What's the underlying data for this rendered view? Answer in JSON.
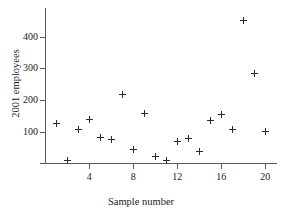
{
  "chart_data": {
    "type": "scatter",
    "title": "",
    "xlabel": "Sample number",
    "ylabel": "2001 employees",
    "x": [
      1,
      2,
      3,
      4,
      5,
      6,
      7,
      8,
      9,
      10,
      11,
      12,
      13,
      14,
      15,
      16,
      17,
      18,
      19,
      20
    ],
    "values": [
      127,
      10,
      106,
      140,
      82,
      76,
      218,
      44,
      158,
      21,
      9,
      70,
      79,
      36,
      135,
      153,
      108,
      452,
      285,
      100
    ],
    "xlim": [
      0,
      21
    ],
    "ylim": [
      0,
      470
    ],
    "xticks": [
      4,
      8,
      12,
      16,
      20
    ],
    "xtick_labels": [
      "4",
      "8",
      "12",
      "16",
      "20"
    ],
    "yticks": [
      0,
      100,
      200,
      300,
      400
    ],
    "ytick_labels": [
      "",
      "100",
      "200",
      "300",
      "400"
    ],
    "grid": false,
    "legend": false,
    "marker": "plus",
    "marker_color": "#2b2b2b",
    "axis_color": "#5a5a5a"
  }
}
